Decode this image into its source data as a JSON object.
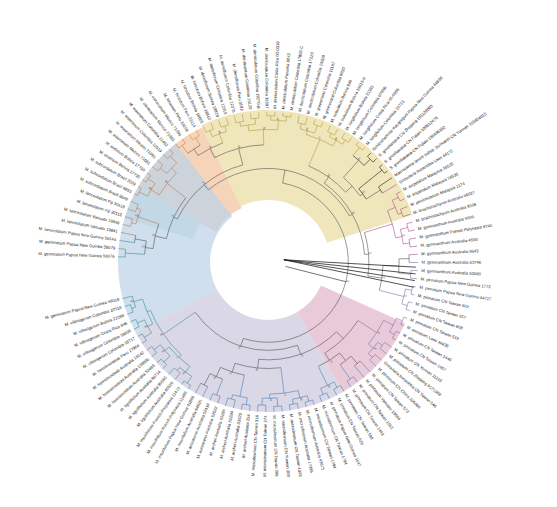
{
  "figure": {
    "type": "circular-phylogram",
    "title": "",
    "width": 557,
    "height": 507,
    "center_x": 268,
    "center_y": 262,
    "background": "#ffffff"
  },
  "clades": [
    {
      "name": "clade-orange",
      "color": "#f2c3a0",
      "label": "",
      "start_angle": -150.0,
      "end_angle": -116.0,
      "inner_radius": 60,
      "outer_radius": 150
    },
    {
      "name": "clade-yellow",
      "color": "#eadca2",
      "label": "",
      "start_angle": -116.0,
      "end_angle": -18.0,
      "inner_radius": 62,
      "outer_radius": 152
    },
    {
      "name": "clade-teal",
      "color": "#c3dedd",
      "label": "",
      "start_angle": -163.0,
      "end_angle": -150.0,
      "inner_radius": 78,
      "outer_radius": 150
    },
    {
      "name": "clade-blue",
      "color": "#bcd2e8",
      "label": "",
      "start_angle": 152.0,
      "end_angle": 232.0,
      "inner_radius": 58,
      "outer_radius": 150
    },
    {
      "name": "clade-lavender",
      "color": "#ccc7de",
      "label": "",
      "start_angle": 60.0,
      "end_angle": 152.0,
      "inner_radius": 58,
      "outer_radius": 150
    },
    {
      "name": "clade-pink",
      "color": "#e0b5cb",
      "label": "",
      "start_angle": 24.0,
      "end_angle": 60.0,
      "inner_radius": 58,
      "outer_radius": 150
    }
  ],
  "branch_colors": {
    "orange": "#c07a4a",
    "yellow": "#b39b3e",
    "teal": "#3f8f93",
    "blue": "#4a7fb5",
    "lavender": "#7a76a8",
    "pink": "#a8538a",
    "black": "#1a1a1a",
    "grey": "#555555"
  },
  "taxa": [
    {
      "label": "M. geminatum Papua New Guinea 56076",
      "group": "teal"
    },
    {
      "label": "M. geminatum Papua New Guinea 56079",
      "group": "teal"
    },
    {
      "label": "M. lanceolatum Papua New Guinea 56144",
      "group": "teal"
    },
    {
      "label": "M. lanceolatum Vanuatu 19841",
      "group": "orange"
    },
    {
      "label": "M. lanceolatum Vanuatu 19849",
      "group": "orange"
    },
    {
      "label": "M. lanceolatum Fiji 30112",
      "group": "orange"
    },
    {
      "label": "M. lanceolatum Fiji 30118",
      "group": "orange"
    },
    {
      "label": "M. subcordatum Brazil 8849",
      "group": "orange"
    },
    {
      "label": "M. subcordatum Brazil 8853",
      "group": "orange"
    },
    {
      "label": "M. subcordatum Brazil 2039",
      "group": "orange"
    },
    {
      "label": "M. andinum Bolivia 17735",
      "group": "orange"
    },
    {
      "label": "M. andinum Bolivia 17739",
      "group": "orange"
    },
    {
      "label": "M. wawranum Mexico 71081",
      "group": "orange"
    },
    {
      "label": "M. wawranum Mexico 71091",
      "group": "orange"
    },
    {
      "label": "M. wawranum Colombia 11519",
      "group": "orange"
    },
    {
      "label": "M. wawranum Colombia 11462",
      "group": "orange"
    },
    {
      "label": "M. oaxacanum Mexico 71083",
      "group": "orange"
    },
    {
      "label": "M. oaxacanum Mexico 71096",
      "group": "orange"
    },
    {
      "label": "M. hirsutum Peru 33109",
      "group": "yellow"
    },
    {
      "label": "M. hirsutum Peru 33114",
      "group": "yellow"
    },
    {
      "label": "M. hirsutum Bolivia 18805",
      "group": "yellow"
    },
    {
      "label": "M. hirsutum Bolivia 18812",
      "group": "yellow"
    },
    {
      "label": "M. densiflorum Bolivia 18819",
      "group": "yellow"
    },
    {
      "label": "M. densiflorum Colombia 12319",
      "group": "yellow"
    },
    {
      "label": "M. densiflorum Colombia 12376",
      "group": "yellow"
    },
    {
      "label": "M. densiflorum Peru 3182",
      "group": "yellow"
    },
    {
      "label": "M. denticulatum Colombia 19120",
      "group": "yellow"
    },
    {
      "label": "M. denticulatum Colombia 19270-B",
      "group": "yellow"
    },
    {
      "label": "M. denticulatum Colombia 19307",
      "group": "yellow"
    },
    {
      "label": "M. denticulatum Costa Rica 00-0319",
      "group": "yellow"
    },
    {
      "label": "M. denticulatum Panama 8042",
      "group": "yellow"
    },
    {
      "label": "M. denticulatum Colombia 17806-C",
      "group": "yellow"
    },
    {
      "label": "M. denticulatum Colombia 17229",
      "group": "yellow"
    },
    {
      "label": "M. denticulatum Colombia 19209",
      "group": "yellow"
    },
    {
      "label": "M. greenmanii Colombia 11197",
      "group": "yellow"
    },
    {
      "label": "M. greenmanii Colombia 9930",
      "group": "yellow"
    },
    {
      "label": "M. subulatum Bolivia 846",
      "group": "yellow"
    },
    {
      "label": "M. subulatum Bolivia 19815-b",
      "group": "yellow"
    },
    {
      "label": "M. longifolium Bolivia 21381",
      "group": "yellow"
    },
    {
      "label": "M. longifolium Colombia 9798B",
      "group": "yellow"
    },
    {
      "label": "M. longifolium Costa Rica 00-0996",
      "group": "yellow"
    },
    {
      "label": "M. longifolium Colombia 10713",
      "group": "yellow"
    },
    {
      "label": "Schizothamnia macgregorii Papua New Guinea 44636",
      "group": "outgroup"
    },
    {
      "label": "S. greviliaeana CN Zhejiang 101128003",
      "group": "outgroup"
    },
    {
      "label": "S. greviliaeana CN Fujian 100612476",
      "group": "outgroup"
    },
    {
      "label": "S. greviliaeana CN Fujian 100406392",
      "group": "outgroup"
    },
    {
      "label": "Macrozamia lanuis subsp. bullivantii CN Yunnan 110454015",
      "group": "outgroup"
    },
    {
      "label": "Grosularia lineariloba Laos 44172",
      "group": "pink"
    },
    {
      "label": "M. oxipetalum Malaysia 18535",
      "group": "pink"
    },
    {
      "label": "M. linipetalum Malaysia 18535",
      "group": "pink"
    },
    {
      "label": "M. peninsulatum Malaysia 1174",
      "group": "pink"
    },
    {
      "label": "M. brachistachyum Australia 56027",
      "group": "pink"
    },
    {
      "label": "M. brachistachyum Australia 9508",
      "group": "pink"
    },
    {
      "label": "M. gymnanthum Australia 9509",
      "group": "pink"
    },
    {
      "label": "M. gymnanthum French Polynesia 9740",
      "group": "pink"
    },
    {
      "label": "M. gymnanthum Australia 4500",
      "group": "pink"
    },
    {
      "label": "M. gymnanthum Australia 9543",
      "group": "pink"
    },
    {
      "label": "M. gymnanthum Australia 53746",
      "group": "lavender"
    },
    {
      "label": "M. gymnanthum Australia 53580",
      "group": "lavender"
    },
    {
      "label": "M. pinnatum Papua New Guinea 1772",
      "group": "lavender"
    },
    {
      "label": "M. pinnatum Papua New Guinea 44727",
      "group": "lavender"
    },
    {
      "label": "M. pinnatum CN Taiwan 602",
      "group": "lavender"
    },
    {
      "label": "M. pinnatum CN Taiwan 617",
      "group": "lavender"
    },
    {
      "label": "M. pinnatum CN Taiwan 608",
      "group": "lavender"
    },
    {
      "label": "M. pinnatum CN Taiwan 519",
      "group": "lavender"
    },
    {
      "label": "M. pinnatum Laos 44436",
      "group": "lavender"
    },
    {
      "label": "M. pinnatum CN Taiwan 1440",
      "group": "lavender"
    },
    {
      "label": "M. pinnatum CN Taiwan 1457",
      "group": "lavender"
    },
    {
      "label": "M. pinnatum CN Yunnan 11113",
      "group": "lavender"
    },
    {
      "label": "M. pinnatum CN Zhejiang 9121388",
      "group": "lavender"
    },
    {
      "label": "Grosularia lineariloba CN Taiwan 546",
      "group": "lavender"
    },
    {
      "label": "M. pinnatum CN China 106060",
      "group": "lavender"
    },
    {
      "label": "M. pinnatum CN Taiwan 573",
      "group": "lavender"
    },
    {
      "label": "M. pinnatum Vanuatu 19584",
      "group": "blue"
    },
    {
      "label": "M. pinnatum CN Taiwan 1552",
      "group": "blue"
    },
    {
      "label": "M. pinnatum CN Taiwan 1443",
      "group": "blue"
    },
    {
      "label": "M. pinnatum CN Taiwan 598",
      "group": "blue"
    },
    {
      "label": "M. pinnatum CN Taiwan 629",
      "group": "blue"
    },
    {
      "label": "M. pinnatum Papua New Guinea 1547",
      "group": "blue"
    },
    {
      "label": "M. microdesmum CN Taiwan 1794",
      "group": "blue"
    },
    {
      "label": "M. microdesmum CN Taiwan 1794",
      "group": "blue"
    },
    {
      "label": "M. microdesmum Australia 42671",
      "group": "blue"
    },
    {
      "label": "M. microdesmum Australia 17396",
      "group": "blue"
    },
    {
      "label": "M. microdesmum CN Taiwan 4303",
      "group": "blue"
    },
    {
      "label": "M. microdesmum CN Yunnan 300",
      "group": "blue"
    },
    {
      "label": "M. microdesmum CN Taiwan 309",
      "group": "blue"
    },
    {
      "label": "M. microdesmum CN Taiwan 274",
      "group": "blue"
    },
    {
      "label": "M. microdesmum CN Taiwan 316",
      "group": "blue"
    },
    {
      "label": "M. archeri Australia 254",
      "group": "blue"
    },
    {
      "label": "M. archeri Australia 31620",
      "group": "blue"
    },
    {
      "label": "M. archeri Australia 61294",
      "group": "blue"
    },
    {
      "label": "M. archeri Australia 61286",
      "group": "blue"
    },
    {
      "label": "M. aureasens Australia 52022",
      "group": "blue"
    },
    {
      "label": "M. aureasens Australia 52419",
      "group": "blue"
    },
    {
      "label": "M. insurifolium Australia 64815",
      "group": "blue"
    },
    {
      "label": "M. insurifolium Papua New Guinea 41600",
      "group": "teal"
    },
    {
      "label": "M. insurifolium French Polynesia 11489",
      "group": "teal"
    },
    {
      "label": "M. insurifolium French Polynesia 11473",
      "group": "teal"
    },
    {
      "label": "M. liguilifolium Australia 80529",
      "group": "teal"
    },
    {
      "label": "M. liguilifolium Australia 80060",
      "group": "teal"
    },
    {
      "label": "M. liguilifolium Australia 80714",
      "group": "teal"
    },
    {
      "label": "M. hemisinoideas Australia 52489",
      "group": "teal"
    },
    {
      "label": "M. hemisinoideas Australia 15860b",
      "group": "teal"
    },
    {
      "label": "M. hemisinoideas Australia 18142",
      "group": "teal"
    },
    {
      "label": "M. hemisinoideas Peru 27964",
      "group": "teal"
    },
    {
      "label": "M. villosigerum Colombia 18717",
      "group": "teal"
    },
    {
      "label": "M. villosigerum Colombia 18806",
      "group": "teal"
    },
    {
      "label": "M. villosigerum Costa Rica 846",
      "group": "teal"
    },
    {
      "label": "M. villosigerum Bolivia 21084",
      "group": "teal"
    },
    {
      "label": "M. villosigerum Colombia 10518",
      "group": "teal"
    },
    {
      "label": "M. geminatum Papua New Guinea 56018",
      "group": "teal"
    }
  ],
  "support_values": [
    "100",
    "100",
    "99",
    "98",
    "97",
    "96",
    "95",
    "94",
    "93",
    "92",
    "91",
    "90",
    "89",
    "88",
    "87",
    "86",
    "85",
    "84",
    "83",
    "82",
    "81",
    "80",
    "79",
    "78",
    "77",
    "76",
    "75",
    "74",
    "73",
    "72",
    "71",
    "70",
    "69",
    "68",
    "67",
    "66",
    "65",
    "64",
    "63",
    "62",
    "61",
    "60",
    "59",
    "58",
    "57",
    "56",
    "55",
    "54",
    "53",
    "52",
    "51",
    "100",
    "100",
    "100",
    "99",
    "98",
    "97",
    "96",
    "95",
    "94",
    "93",
    "92",
    "91",
    "90",
    "89",
    "88",
    "87",
    "86",
    "85",
    "84",
    "83",
    "82",
    "81",
    "80",
    "79",
    "78",
    "77",
    "76",
    "75",
    "74",
    "73",
    "72",
    "71",
    "70"
  ]
}
